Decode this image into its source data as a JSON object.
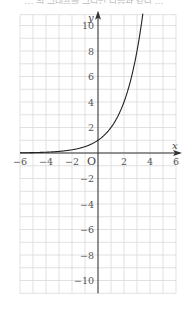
{
  "caption": "… 의 그래프를 그리면 다음과 같다 …",
  "chart_data": {
    "type": "line",
    "title": "",
    "function": "y = 2^x",
    "xlabel": "x",
    "ylabel": "y",
    "origin_label": "O",
    "xlim": [
      -6,
      6
    ],
    "ylim": [
      -11,
      11
    ],
    "grid": true,
    "grid_step": 1,
    "x_ticks": [
      -6,
      -4,
      -2,
      2,
      4,
      6
    ],
    "x_tick_labels": [
      "−6",
      "−4",
      "−2",
      "2",
      "4",
      "6"
    ],
    "y_ticks": [
      10,
      8,
      6,
      4,
      2,
      -2,
      -4,
      -6,
      -8,
      -10
    ],
    "y_tick_labels": [
      "10",
      "8",
      "6",
      "4",
      "2",
      "−2",
      "−4",
      "−6",
      "−8",
      "−10"
    ],
    "series": [
      {
        "name": "y = 2^x",
        "x": [
          -6,
          -5,
          -4,
          -3,
          -2,
          -1,
          0,
          1,
          2,
          3,
          3.46
        ],
        "y": [
          0.016,
          0.031,
          0.063,
          0.125,
          0.25,
          0.5,
          1,
          2,
          4,
          8,
          11
        ]
      }
    ],
    "colors": {
      "grid": "#d9d9d9",
      "axis": "#333333",
      "curve": "#222222",
      "label": "#555555"
    }
  }
}
